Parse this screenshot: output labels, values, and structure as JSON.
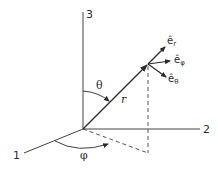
{
  "diagram": {
    "type": "spherical-coordinates",
    "axes": [
      {
        "id": "axis-1",
        "label": "1"
      },
      {
        "id": "axis-2",
        "label": "2"
      },
      {
        "id": "axis-3",
        "label": "3"
      }
    ],
    "position_vector": {
      "label": "r"
    },
    "angles": {
      "polar": {
        "label": "θ"
      },
      "azimuthal": {
        "label": "φ"
      }
    },
    "unit_vectors": [
      {
        "id": "e_r",
        "base": "ê",
        "sub": "r"
      },
      {
        "id": "e_phi",
        "base": "ê",
        "sub": "φ"
      },
      {
        "id": "e_theta",
        "base": "ê",
        "sub": "θ"
      }
    ],
    "colors": {
      "stroke": "#2a2a2a",
      "background": "#ffffff"
    }
  }
}
